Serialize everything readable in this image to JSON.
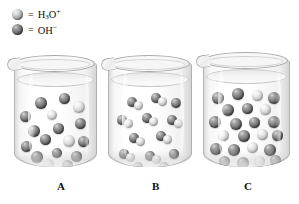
{
  "figure": {
    "background_color": "#ffffff",
    "style": "grayscale textbook illustration"
  },
  "legend": {
    "entries": [
      {
        "marker": "light-sphere",
        "marker_icon": "sphere-icon",
        "equals": "=",
        "formula_html": "H3O+",
        "formula_base": "H",
        "formula_sub": "3",
        "formula_mid": "O",
        "formula_sup": "+",
        "species": "hydronium ion",
        "color": "#d8d8d8"
      },
      {
        "marker": "dark-sphere",
        "marker_icon": "sphere-icon",
        "equals": "=",
        "formula_html": "OH-",
        "formula_base": "O",
        "formula_sub": "",
        "formula_mid": "H",
        "formula_sup": "−",
        "species": "hydroxide ion",
        "color": "#5c5c5c"
      }
    ]
  },
  "beakers": [
    {
      "label": "A",
      "label_x": 57,
      "x": 14,
      "y": 55,
      "width": 81,
      "height": 112,
      "sphere_count": 17,
      "dark_count": 13,
      "light_count": 4,
      "description": "acidic - more hydronium than hydroxide",
      "molecules": [
        {
          "x": 20,
          "y": 34,
          "d": 12,
          "type": "dark"
        },
        {
          "x": 44,
          "y": 30,
          "d": 11,
          "type": "dark"
        },
        {
          "x": 5,
          "y": 48,
          "d": 11,
          "type": "dark"
        },
        {
          "x": 32,
          "y": 47,
          "d": 10,
          "type": "light"
        },
        {
          "x": 58,
          "y": 38,
          "d": 12,
          "type": "light"
        },
        {
          "x": 13,
          "y": 62,
          "d": 12,
          "type": "dark"
        },
        {
          "x": 38,
          "y": 60,
          "d": 11,
          "type": "dark"
        },
        {
          "x": 60,
          "y": 55,
          "d": 11,
          "type": "dark"
        },
        {
          "x": 25,
          "y": 71,
          "d": 11,
          "type": "dark"
        },
        {
          "x": 48,
          "y": 72,
          "d": 12,
          "type": "light"
        },
        {
          "x": 6,
          "y": 78,
          "d": 11,
          "type": "dark"
        },
        {
          "x": 63,
          "y": 73,
          "d": 11,
          "type": "dark"
        },
        {
          "x": 16,
          "y": 88,
          "d": 12,
          "type": "dark"
        },
        {
          "x": 37,
          "y": 85,
          "d": 10,
          "type": "dark"
        },
        {
          "x": 56,
          "y": 88,
          "d": 11,
          "type": "dark"
        },
        {
          "x": 28,
          "y": 96,
          "d": 11,
          "type": "light"
        },
        {
          "x": 47,
          "y": 97,
          "d": 11,
          "type": "dark"
        }
      ]
    },
    {
      "label": "B",
      "label_x": 152,
      "x": 108,
      "y": 55,
      "width": 82,
      "height": 112,
      "sphere_count": 16,
      "dark_count": 8,
      "light_count": 8,
      "description": "neutral - equal hydronium and hydroxide",
      "molecules": [
        {
          "x": 18,
          "y": 34,
          "d": 10,
          "type": "dark"
        },
        {
          "x": 25,
          "y": 38,
          "d": 9,
          "type": "light"
        },
        {
          "x": 42,
          "y": 30,
          "d": 10,
          "type": "dark"
        },
        {
          "x": 49,
          "y": 34,
          "d": 9,
          "type": "light"
        },
        {
          "x": 62,
          "y": 35,
          "d": 10,
          "type": "dark"
        },
        {
          "x": 8,
          "y": 52,
          "d": 10,
          "type": "dark"
        },
        {
          "x": 15,
          "y": 56,
          "d": 9,
          "type": "light"
        },
        {
          "x": 33,
          "y": 50,
          "d": 10,
          "type": "dark"
        },
        {
          "x": 40,
          "y": 54,
          "d": 9,
          "type": "light"
        },
        {
          "x": 58,
          "y": 52,
          "d": 10,
          "type": "dark"
        },
        {
          "x": 65,
          "y": 56,
          "d": 9,
          "type": "light"
        },
        {
          "x": 20,
          "y": 70,
          "d": 10,
          "type": "dark"
        },
        {
          "x": 27,
          "y": 74,
          "d": 9,
          "type": "light"
        },
        {
          "x": 47,
          "y": 68,
          "d": 10,
          "type": "dark"
        },
        {
          "x": 54,
          "y": 72,
          "d": 9,
          "type": "light"
        },
        {
          "x": 10,
          "y": 86,
          "d": 10,
          "type": "dark"
        },
        {
          "x": 17,
          "y": 90,
          "d": 9,
          "type": "light"
        },
        {
          "x": 36,
          "y": 88,
          "d": 10,
          "type": "dark"
        },
        {
          "x": 43,
          "y": 92,
          "d": 9,
          "type": "light"
        },
        {
          "x": 60,
          "y": 86,
          "d": 10,
          "type": "dark"
        },
        {
          "x": 24,
          "y": 99,
          "d": 10,
          "type": "dark"
        },
        {
          "x": 50,
          "y": 99,
          "d": 10,
          "type": "dark"
        }
      ]
    },
    {
      "label": "C",
      "label_x": 244,
      "x": 203,
      "y": 52,
      "width": 85,
      "height": 115,
      "sphere_count": 23,
      "dark_count": 17,
      "light_count": 6,
      "description": "basic - more hydroxide, densely packed",
      "molecules": [
        {
          "x": 8,
          "y": 32,
          "d": 12,
          "type": "dark"
        },
        {
          "x": 28,
          "y": 28,
          "d": 12,
          "type": "dark"
        },
        {
          "x": 48,
          "y": 30,
          "d": 11,
          "type": "light"
        },
        {
          "x": 64,
          "y": 32,
          "d": 12,
          "type": "dark"
        },
        {
          "x": 18,
          "y": 44,
          "d": 12,
          "type": "dark"
        },
        {
          "x": 38,
          "y": 43,
          "d": 11,
          "type": "dark"
        },
        {
          "x": 56,
          "y": 44,
          "d": 11,
          "type": "light"
        },
        {
          "x": 5,
          "y": 56,
          "d": 12,
          "type": "dark"
        },
        {
          "x": 26,
          "y": 58,
          "d": 12,
          "type": "dark"
        },
        {
          "x": 45,
          "y": 57,
          "d": 11,
          "type": "dark"
        },
        {
          "x": 64,
          "y": 56,
          "d": 12,
          "type": "dark"
        },
        {
          "x": 14,
          "y": 70,
          "d": 11,
          "type": "light"
        },
        {
          "x": 34,
          "y": 70,
          "d": 12,
          "type": "dark"
        },
        {
          "x": 53,
          "y": 69,
          "d": 11,
          "type": "light"
        },
        {
          "x": 68,
          "y": 70,
          "d": 11,
          "type": "dark"
        },
        {
          "x": 6,
          "y": 83,
          "d": 12,
          "type": "dark"
        },
        {
          "x": 24,
          "y": 84,
          "d": 12,
          "type": "dark"
        },
        {
          "x": 43,
          "y": 82,
          "d": 11,
          "type": "light"
        },
        {
          "x": 60,
          "y": 84,
          "d": 12,
          "type": "dark"
        },
        {
          "x": 15,
          "y": 96,
          "d": 11,
          "type": "dark"
        },
        {
          "x": 33,
          "y": 97,
          "d": 12,
          "type": "dark"
        },
        {
          "x": 50,
          "y": 96,
          "d": 11,
          "type": "light"
        },
        {
          "x": 66,
          "y": 95,
          "d": 11,
          "type": "dark"
        }
      ]
    }
  ]
}
